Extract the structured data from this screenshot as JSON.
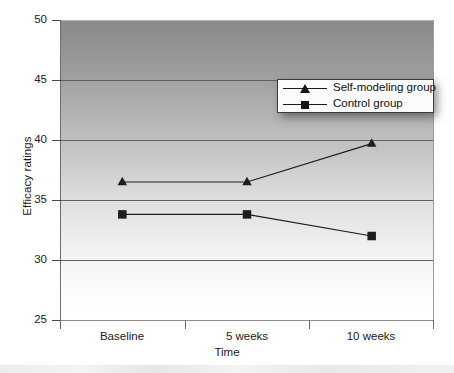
{
  "chart_data": {
    "type": "line",
    "title": "",
    "xlabel": "Time",
    "ylabel": "Efficacy ratings",
    "categories": [
      "Baseline",
      "5 weeks",
      "10 weeks"
    ],
    "ylim": [
      25,
      50
    ],
    "yticks": [
      25,
      30,
      35,
      40,
      45,
      50
    ],
    "ytick_labels": [
      "25",
      "30",
      "35",
      "40",
      "45",
      "50"
    ],
    "grid": "horizontal",
    "legend_position": "upper right",
    "series": [
      {
        "name": "Self-modeling group",
        "marker": "triangle",
        "color": "#1d1d1d",
        "values": [
          36.5,
          36.5,
          39.7
        ]
      },
      {
        "name": "Control group",
        "marker": "square",
        "color": "#1d1d1d",
        "values": [
          33.8,
          33.8,
          32.0
        ]
      }
    ]
  },
  "axes": {
    "y_title": "Efficacy ratings",
    "x_title": "Time",
    "y_tick_labels": [
      "50",
      "45",
      "40",
      "35",
      "30",
      "25"
    ],
    "x_tick_labels": [
      "Baseline",
      "5 weeks",
      "10 weeks"
    ]
  },
  "legend": {
    "items": [
      {
        "label": "Self-modeling group",
        "marker_name": "triangle-marker-icon"
      },
      {
        "label": "Control group",
        "marker_name": "square-marker-icon"
      }
    ]
  }
}
